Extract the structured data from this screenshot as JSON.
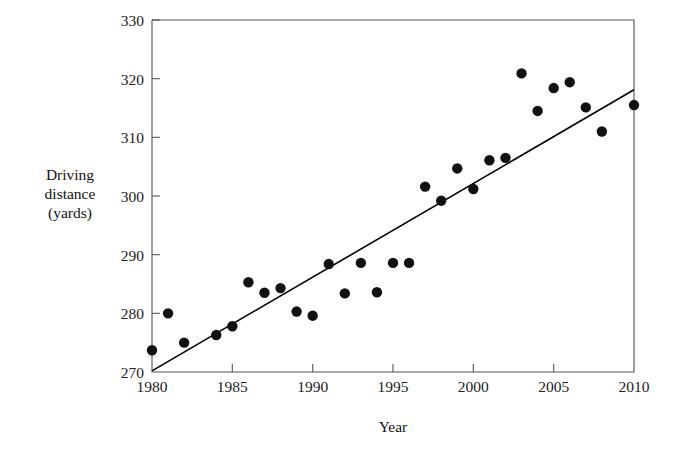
{
  "chart_data": {
    "type": "scatter",
    "title": "",
    "xlabel": "Year",
    "ylabel": "Driving distance (yards)",
    "ylabel_lines": [
      "Driving",
      "distance",
      "(yards)"
    ],
    "xlim": [
      1980,
      2010
    ],
    "ylim": [
      270,
      330
    ],
    "xticks": [
      1980,
      1985,
      1990,
      1995,
      2000,
      2005,
      2010
    ],
    "xtick_labels": [
      "1980",
      "1985",
      "1990",
      "1995",
      "2000",
      "2005",
      "2010"
    ],
    "yticks": [
      270,
      280,
      290,
      300,
      310,
      320,
      330
    ],
    "ytick_labels": [
      "270",
      "280",
      "290",
      "300",
      "310",
      "320",
      "330"
    ],
    "grid": false,
    "legend": null,
    "x": [
      1980,
      1981,
      1982,
      1984,
      1985,
      1986,
      1987,
      1988,
      1989,
      1990,
      1991,
      1992,
      1993,
      1994,
      1995,
      1996,
      1997,
      1998,
      1999,
      2000,
      2001,
      2002,
      2003,
      2004,
      2005,
      2006,
      2007,
      2008,
      2010
    ],
    "values": [
      273.7,
      280.0,
      275.0,
      276.3,
      277.8,
      285.3,
      283.5,
      284.3,
      280.3,
      279.6,
      288.4,
      283.4,
      288.6,
      283.6,
      288.6,
      288.6,
      301.6,
      299.2,
      304.7,
      301.2,
      306.1,
      306.5,
      320.9,
      314.5,
      318.4,
      319.4,
      315.1,
      311.0,
      315.5
    ],
    "point_color": "#111111",
    "point_style": "filled-circle",
    "trend_line": {
      "x_start": 1980,
      "y_start": 270.2,
      "x_end": 2010,
      "y_end": 318.1,
      "color": "#000000"
    }
  },
  "axis": {
    "x_title": "Year",
    "y_title_line1": "Driving",
    "y_title_line2": "distance",
    "y_title_line3": "(yards)"
  }
}
